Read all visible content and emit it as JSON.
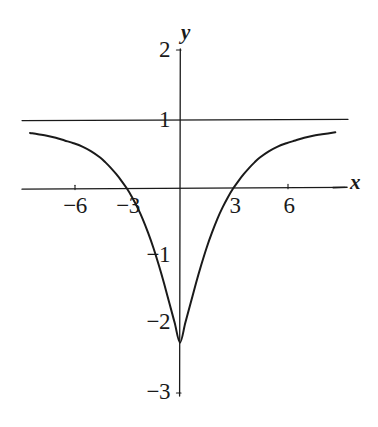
{
  "figure": {
    "name": "function-graph",
    "background_color": "#ffffff",
    "ink_color": "#1a1a1a",
    "width": 378,
    "height": 427
  },
  "chart_data": {
    "type": "line",
    "title": "",
    "xlabel": "x",
    "ylabel": "y",
    "xlim": [
      -8.9,
      9.3
    ],
    "ylim": [
      -3,
      2
    ],
    "grid": true,
    "legend": null,
    "gridlines_y": [
      1,
      0
    ],
    "x_ticks": [
      -6,
      -3,
      3,
      6
    ],
    "x_tick_labels": [
      "−6",
      "−3",
      "3",
      "6"
    ],
    "y_ticks": [
      2,
      1,
      -1,
      -2,
      -3
    ],
    "y_tick_labels": [
      "2",
      "1",
      "−1",
      "−2",
      "−3"
    ],
    "axis_labels": {
      "x": "x",
      "y": "y"
    },
    "series": [
      {
        "name": "curve",
        "color": "#1a1a1a",
        "x": [
          -8.45,
          -8.0,
          -7.5,
          -7.0,
          -6.5,
          -6.0,
          -5.5,
          -5.0,
          -4.5,
          -4.2,
          -3.9,
          -3.6,
          -3.3,
          -3.0,
          -2.7,
          -2.4,
          -2.1,
          -1.8,
          -1.5,
          -1.2,
          -0.9,
          -0.6,
          -0.3,
          0.0,
          0.3,
          0.6,
          0.9,
          1.2,
          1.5,
          1.8,
          2.1,
          2.4,
          2.7,
          3.0,
          3.3,
          3.6,
          3.9,
          4.2,
          4.5,
          5.0,
          5.5,
          6.0,
          6.5,
          7.0,
          7.5,
          8.0,
          8.75
        ],
        "y": [
          0.81,
          0.79,
          0.77,
          0.74,
          0.7,
          0.66,
          0.61,
          0.54,
          0.45,
          0.38,
          0.3,
          0.21,
          0.11,
          0.0,
          -0.13,
          -0.28,
          -0.45,
          -0.65,
          -0.87,
          -1.12,
          -1.39,
          -1.68,
          -1.97,
          -2.26,
          -1.97,
          -1.68,
          -1.39,
          -1.12,
          -0.87,
          -0.65,
          -0.45,
          -0.28,
          -0.13,
          0.0,
          0.11,
          0.21,
          0.3,
          0.38,
          0.45,
          0.54,
          0.61,
          0.66,
          0.7,
          0.74,
          0.77,
          0.79,
          0.82
        ],
        "minimum": {
          "x": 0,
          "y": -2.26
        },
        "zeros": [
          -3,
          3
        ],
        "asymptote_y": 1
      }
    ]
  },
  "annotations": {
    "y_axis_top_value": "2",
    "y_axis_bottom_value": "−3"
  }
}
